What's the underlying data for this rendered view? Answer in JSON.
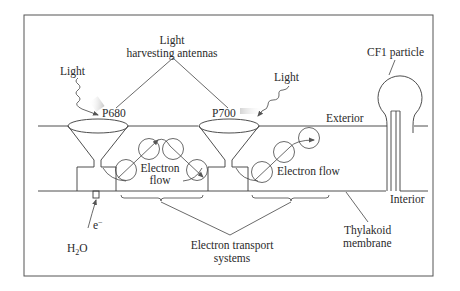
{
  "figure": {
    "labels": {
      "antennas_line1": "Light",
      "antennas_line2": "harvesting antennas",
      "light_left": "Light",
      "light_right": "Light",
      "p680": "P680",
      "p700": "P700",
      "cf1": "CF1 particle",
      "exterior": "Exterior",
      "interior": "Interior",
      "electron_flow_left_line1": "Electron",
      "electron_flow_left_line2": "flow",
      "electron_flow_right": "Electron flow",
      "electron_sub": "e",
      "electron_sup": "−",
      "water_h": "H",
      "water_2": "2",
      "water_o": "O",
      "ets_line1": "Electron transport",
      "ets_line2": "systems",
      "membrane_line1": "Thylakoid",
      "membrane_line2": "membrane"
    },
    "components": [
      {
        "name": "Photosystem II reaction center",
        "label": "P680"
      },
      {
        "name": "Photosystem I reaction center",
        "label": "P700"
      },
      {
        "name": "Left electron transport system",
        "carriers": 4
      },
      {
        "name": "Right electron transport system",
        "carriers": 3
      },
      {
        "name": "ATP synthase head",
        "label": "CF1 particle"
      }
    ],
    "colors": {
      "line": "#3a3a3a",
      "text": "#2a2a2a",
      "highlight": "#c8c8c8",
      "background": "#ffffff"
    }
  }
}
